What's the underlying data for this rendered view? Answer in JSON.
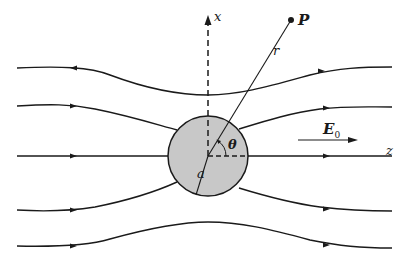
{
  "figure": {
    "labels": {
      "x_axis": "x",
      "z_axis": "z",
      "point": "P",
      "radius_vector": "r",
      "angle": "θ",
      "sphere_radius": "a",
      "field": "E",
      "field_subscript": "0"
    },
    "colors": {
      "line": "#1a1a1a",
      "sphere_fill": "#c8c8c8",
      "background": "#ffffff"
    },
    "sphere": {
      "cx": 208,
      "cy": 156,
      "r": 40
    },
    "field_lines": [
      {
        "name": "field-line-top",
        "path": "M17,68 C60,66 90,67 110,75 C150,90 180,95 208,95 C240,95 270,86 310,75 C340,68 360,67 392,67"
      },
      {
        "name": "field-line-upper",
        "path": "M17,106 C50,104 70,104 95,109 C130,116 155,124 177,130 M239,129 C265,121 290,113 320,109 C345,106 365,107 392,107"
      },
      {
        "name": "field-line-axis",
        "path": "M17,156 L168,156 M248,156 L392,156"
      },
      {
        "name": "field-line-lower",
        "path": "M17,210 C50,212 70,211 95,207 C130,200 155,192 177,182 M239,188 C265,196 290,203 320,207 C345,210 365,211 392,211"
      },
      {
        "name": "field-line-bottom",
        "path": "M17,246 C60,247 90,245 110,239 C150,228 180,222 208,222 C240,222 270,229 310,240 C340,246 360,248 392,248"
      }
    ]
  }
}
